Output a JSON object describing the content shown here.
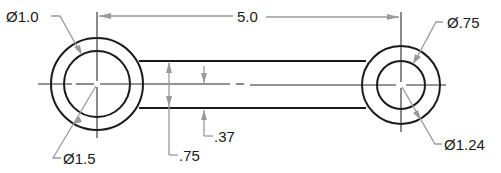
{
  "drawing": {
    "title": "Link part drawing",
    "labels": {
      "overall_length": "5.0",
      "left_inner_diameter": "Ø1.0",
      "left_outer_diameter": "Ø1.5",
      "right_inner_diameter": "Ø.75",
      "right_outer_diameter": "Ø1.24",
      "bar_width": ".75",
      "half_bar_width": ".37"
    },
    "colors": {
      "geometry": "#1a1a1a",
      "dimension": "#9a9a9a",
      "background": "#ffffff"
    }
  }
}
